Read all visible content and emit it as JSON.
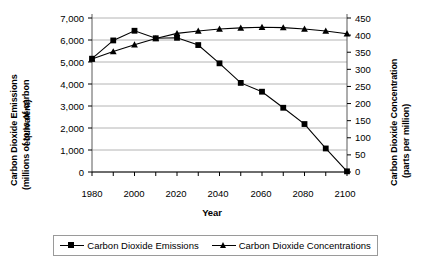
{
  "chart_data": {
    "type": "line",
    "title": "",
    "xlabel": "Year",
    "x": [
      1980,
      1990,
      2000,
      2010,
      2020,
      2030,
      2040,
      2050,
      2060,
      2070,
      2080,
      2090,
      2100
    ],
    "xlim": [
      1980,
      2100
    ],
    "xtick_labels": [
      "1980",
      "2000",
      "2020",
      "2040",
      "2060",
      "2080",
      "2100"
    ],
    "xticks_major": [
      1980,
      2000,
      2020,
      2040,
      2060,
      2080,
      2100
    ],
    "xticks_minor": [
      1990,
      2010,
      2030,
      2050,
      2070,
      2090
    ],
    "grid": true,
    "legend_position": "bottom",
    "axes": [
      {
        "side": "left",
        "label_line1": "Carbon Dioxide Emissions",
        "label_line2": "(millions of tons of carbon",
        "label_line3": "equivalent)",
        "ylim": [
          0,
          7000
        ],
        "tick_step": 1000,
        "tick_labels": [
          "7,000",
          "6,000",
          "5,000",
          "4,000",
          "3,000",
          "2,000",
          "1,000",
          "0"
        ],
        "tick_values": [
          7000,
          6000,
          5000,
          4000,
          3000,
          2000,
          1000,
          0
        ]
      },
      {
        "side": "right",
        "label_line1": "Carbon Dioxide Concentration",
        "label_line2": "(parts per million)",
        "ylim": [
          0,
          450
        ],
        "tick_step": 50,
        "tick_labels": [
          "450",
          "400",
          "350",
          "300",
          "250",
          "200",
          "150",
          "100",
          "50",
          "0"
        ],
        "tick_values": [
          450,
          400,
          350,
          300,
          250,
          200,
          150,
          100,
          50,
          0
        ]
      }
    ],
    "series": [
      {
        "name": "Carbon Dioxide Emissions",
        "axis": "left",
        "marker": "square",
        "color": "#000000",
        "values": [
          5150,
          5980,
          6420,
          6080,
          6100,
          5770,
          4940,
          4050,
          3650,
          2920,
          2180,
          1070,
          30
        ]
      },
      {
        "name": "Carbon Dioxide Concentrations",
        "axis": "right",
        "marker": "triangle",
        "color": "#000000",
        "values": [
          330,
          352,
          372,
          390,
          405,
          412,
          418,
          421,
          423,
          422,
          418,
          412,
          404
        ]
      }
    ]
  },
  "legend": {
    "entries": [
      {
        "label": "Carbon Dioxide Emissions",
        "marker": "square-marker"
      },
      {
        "label": "Carbon Dioxide Concentrations",
        "marker": "triangle-marker"
      }
    ]
  }
}
